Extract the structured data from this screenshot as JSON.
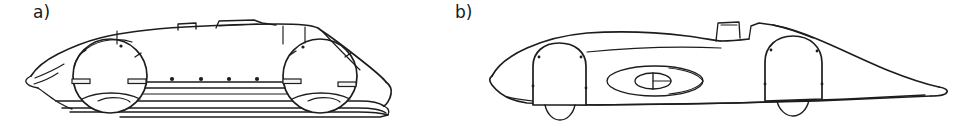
{
  "figure": {
    "kind": "technical-line-drawing",
    "background_color": "#ffffff",
    "ink_color": "#1d1d1d",
    "width_px": 977,
    "height_px": 129,
    "panels": [
      {
        "id": "a",
        "label": "a)",
        "caption_position": "top-left",
        "subject": "vehicle side view with open wheel arches and exposed chassis side rails",
        "features": [
          "pointed nose",
          "front wheel circle",
          "rear wheel circle",
          "side sill rail with rivet row",
          "roof air scoop",
          "cockpit canopy fairing",
          "tapered tail with cut-off rear"
        ],
        "rivet_count": 6
      },
      {
        "id": "b",
        "label": "b)",
        "caption_position": "top-left",
        "subject": "vehicle side view with fully enclosed wheel fairings and long tapered tail",
        "features": [
          "rounded nose",
          "front wheel fairing pod",
          "rear wheel fairing pod",
          "oval side vent with centre spinner",
          "windscreen and headrest fairing",
          "long pointed tail"
        ],
        "fastener_count": 8
      }
    ]
  }
}
